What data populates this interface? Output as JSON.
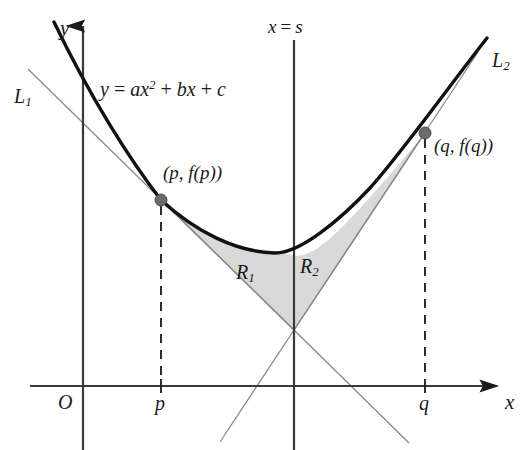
{
  "figure": {
    "background_color": "#ffffff",
    "width": 529,
    "height": 450
  },
  "colors": {
    "curve": "#111111",
    "axis": "#3a3a3a",
    "tangent_line": "#8a8a8a",
    "dashed": "#2b2b2b",
    "shade_fill": "#d9d9d9",
    "shade_stroke": "#8a8a8a",
    "point_dot": "#6b6b6b",
    "text": "#1a1a1a"
  },
  "axes": {
    "y_label": "y",
    "x_label": "x",
    "origin_label": "O",
    "y_axis_x": 83,
    "x_axis_y": 386,
    "x_axis_end": 500,
    "y_axis_top": 22
  },
  "ticks": [
    {
      "name": "p",
      "label": "p",
      "x": 161
    },
    {
      "name": "q",
      "label": "q",
      "x": 425
    }
  ],
  "vertical_line": {
    "label_x": "x",
    "label_eq": "=",
    "label_s": "s",
    "x": 294,
    "top": 40,
    "bottom": 450
  },
  "curve": {
    "equation_y": "y",
    "equation_eq": "=",
    "equation_a": "a",
    "equation_x": "x",
    "equation_exp": "2",
    "equation_plus1": "+",
    "equation_b": "b",
    "equation_x2": "x",
    "equation_plus2": "+",
    "equation_c": "c",
    "vertex_x": 275,
    "vertex_y": 253
  },
  "tangents": [
    {
      "name": "L1",
      "label_base": "L",
      "label_sub": "1",
      "tangent_point_x": 161,
      "tangent_point_y": 200
    },
    {
      "name": "L2",
      "label_base": "L",
      "label_sub": "2",
      "tangent_point_x": 425,
      "tangent_point_y": 133
    }
  ],
  "points": [
    {
      "name": "point-p",
      "label": "(p, f(p))",
      "label_open": "(",
      "label_var": "p",
      "label_comma": ",",
      "label_fn": "f",
      "label_close": "(p))",
      "x": 161,
      "y": 200
    },
    {
      "name": "point-q",
      "label": "(q, f(q))",
      "label_open": "(",
      "label_var": "q",
      "label_comma": ",",
      "label_fn": "f",
      "label_close": "(q))",
      "x": 425,
      "y": 133
    }
  ],
  "regions": [
    {
      "name": "R1",
      "label_base": "R",
      "label_sub": "1",
      "description": "Region bounded by parabola, tangent L1, and line x = s"
    },
    {
      "name": "R2",
      "label_base": "R",
      "label_sub": "2",
      "description": "Region bounded by parabola, tangent L2, and line x = s"
    }
  ],
  "intersection": {
    "name": "tangent-intersection",
    "x": 294,
    "y": 330
  }
}
